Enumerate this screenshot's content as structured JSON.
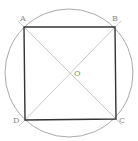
{
  "diagram": {
    "type": "square-inscribed-in-circle",
    "circle": {
      "cx": 69,
      "cy": 73,
      "r": 64,
      "stroke": "#aaaaaa"
    },
    "square": {
      "stroke": "#333333",
      "vertices": {
        "A": [
          24,
          27
        ],
        "B": [
          115,
          27
        ],
        "C": [
          116,
          119
        ],
        "D": [
          25,
          120
        ]
      }
    },
    "diagonals": {
      "stroke": "#bbbbbb",
      "lines": [
        "AC",
        "BD"
      ]
    },
    "labels": {
      "A": {
        "text": "A",
        "x": 20,
        "y": 21
      },
      "B": {
        "text": "B",
        "x": 112,
        "y": 21
      },
      "C": {
        "text": "C",
        "x": 119,
        "y": 123
      },
      "D": {
        "text": "D",
        "x": 13,
        "y": 123
      },
      "O": {
        "text": "O",
        "x": 74,
        "y": 75
      }
    }
  }
}
